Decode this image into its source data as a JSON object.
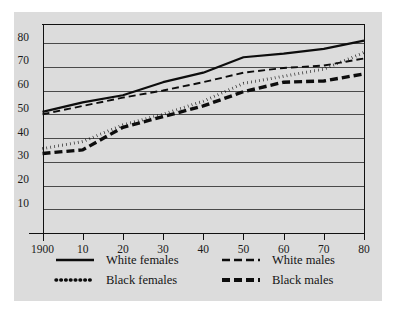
{
  "chart_data": {
    "type": "line",
    "title": "",
    "subtitle": "",
    "xlabel": "",
    "ylabel": "",
    "xlim": [
      1900,
      1980
    ],
    "ylim": [
      0,
      88
    ],
    "grid": true,
    "legend_position": "bottom",
    "x_tick_labels": [
      "1900",
      "10",
      "20",
      "30",
      "40",
      "50",
      "60",
      "70",
      "80"
    ],
    "x": [
      1900,
      1910,
      1920,
      1930,
      1940,
      1950,
      1960,
      1970,
      1980
    ],
    "y_tick_labels": [
      "10",
      "20",
      "30",
      "40",
      "50",
      "60",
      "70",
      "80"
    ],
    "y_ticks": [
      10,
      20,
      30,
      40,
      50,
      60,
      70,
      80
    ],
    "series": [
      {
        "name": "White females",
        "style": "solid",
        "color": "#0d0d0d",
        "values": [
          51.0,
          55.0,
          58.0,
          63.5,
          67.5,
          74.0,
          75.5,
          77.5,
          81.0
        ]
      },
      {
        "name": "White males",
        "style": "dashed-thin",
        "color": "#0d0d0d",
        "values": [
          50.0,
          53.5,
          57.0,
          60.0,
          63.5,
          67.5,
          69.5,
          70.5,
          73.5
        ]
      },
      {
        "name": "Black females",
        "style": "dotted",
        "color": "#0d0d0d",
        "values": [
          35.5,
          38.5,
          45.5,
          50.0,
          55.5,
          63.0,
          66.0,
          69.0,
          76.0
        ]
      },
      {
        "name": "Black males",
        "style": "dashed-thick",
        "color": "#0d0d0d",
        "values": [
          33.5,
          35.0,
          44.5,
          49.0,
          53.5,
          59.5,
          63.5,
          64.0,
          67.0
        ]
      }
    ]
  },
  "legend": {
    "entries": [
      {
        "label": "White females",
        "style": "solid"
      },
      {
        "label": "White males",
        "style": "dashed-thin"
      },
      {
        "label": "Black females",
        "style": "dotted"
      },
      {
        "label": "Black males",
        "style": "dashed-thick"
      }
    ]
  },
  "colors": {
    "figure_background": "#dcdcdc",
    "page_background": "#ffffff",
    "ink": "#0d0d0d",
    "gridline": "#4a4a4a"
  }
}
